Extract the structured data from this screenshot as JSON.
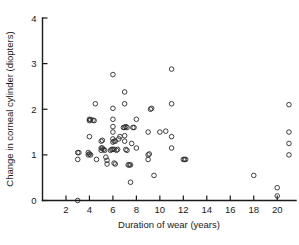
{
  "chart_data": {
    "type": "scatter",
    "title": "",
    "xlabel": "Duration of wear (years)",
    "ylabel": "Change in corneal cylinder (diopters)",
    "xlim": [
      0,
      21.6
    ],
    "ylim": [
      0,
      4
    ],
    "xticks": [
      2,
      4,
      6,
      8,
      10,
      12,
      14,
      16,
      18,
      20
    ],
    "xticklabels": [
      "2",
      "4",
      "6",
      "8",
      "10",
      "12",
      "14",
      "16",
      "18",
      "20"
    ],
    "yticks": [
      0,
      1,
      2,
      3,
      4
    ],
    "yticklabels": [
      "0",
      "1",
      "2",
      "3",
      "4"
    ],
    "grid": false,
    "legend": null,
    "marker": "open-circle",
    "marker_color": "#2b2b2b",
    "points": [
      [
        3.0,
        0.0
      ],
      [
        3.0,
        0.9
      ],
      [
        3.0,
        1.05
      ],
      [
        3.1,
        1.05
      ],
      [
        3.9,
        1.0
      ],
      [
        3.9,
        1.05
      ],
      [
        4.0,
        1.02
      ],
      [
        4.1,
        1.0
      ],
      [
        4.0,
        1.4
      ],
      [
        4.0,
        1.78
      ],
      [
        4.0,
        1.75
      ],
      [
        4.1,
        1.77
      ],
      [
        4.3,
        1.76
      ],
      [
        4.4,
        1.75
      ],
      [
        4.5,
        2.12
      ],
      [
        4.6,
        0.9
      ],
      [
        5.0,
        1.15
      ],
      [
        5.1,
        1.15
      ],
      [
        5.0,
        1.3
      ],
      [
        5.1,
        1.32
      ],
      [
        5.0,
        1.1
      ],
      [
        5.2,
        1.12
      ],
      [
        5.3,
        1.1
      ],
      [
        5.4,
        0.95
      ],
      [
        5.5,
        0.88
      ],
      [
        5.5,
        0.8
      ],
      [
        5.8,
        1.1
      ],
      [
        5.9,
        1.12
      ],
      [
        6.0,
        1.12
      ],
      [
        6.1,
        1.12
      ],
      [
        6.0,
        1.28
      ],
      [
        6.1,
        1.3
      ],
      [
        6.2,
        1.3
      ],
      [
        6.0,
        1.35
      ],
      [
        6.0,
        1.5
      ],
      [
        6.0,
        1.62
      ],
      [
        6.0,
        1.78
      ],
      [
        6.0,
        2.02
      ],
      [
        6.0,
        2.76
      ],
      [
        6.1,
        0.82
      ],
      [
        6.2,
        0.8
      ],
      [
        6.3,
        1.1
      ],
      [
        6.4,
        1.12
      ],
      [
        6.5,
        1.35
      ],
      [
        6.6,
        1.4
      ],
      [
        6.9,
        1.6
      ],
      [
        7.0,
        1.6
      ],
      [
        7.1,
        1.62
      ],
      [
        7.2,
        1.6
      ],
      [
        7.0,
        2.12
      ],
      [
        7.0,
        2.38
      ],
      [
        7.0,
        1.42
      ],
      [
        7.0,
        1.3
      ],
      [
        7.1,
        1.12
      ],
      [
        7.2,
        1.1
      ],
      [
        7.3,
        0.78
      ],
      [
        7.4,
        0.78
      ],
      [
        7.5,
        0.78
      ],
      [
        7.5,
        0.4
      ],
      [
        7.6,
        1.25
      ],
      [
        7.7,
        1.6
      ],
      [
        7.8,
        1.6
      ],
      [
        8.0,
        1.78
      ],
      [
        8.0,
        1.15
      ],
      [
        9.0,
        1.0
      ],
      [
        9.1,
        1.02
      ],
      [
        9.0,
        0.9
      ],
      [
        9.2,
        2.0
      ],
      [
        9.3,
        2.02
      ],
      [
        9.0,
        1.5
      ],
      [
        9.5,
        0.55
      ],
      [
        10.0,
        1.5
      ],
      [
        10.5,
        1.52
      ],
      [
        11.0,
        2.12
      ],
      [
        11.0,
        2.88
      ],
      [
        11.0,
        1.4
      ],
      [
        11.0,
        1.15
      ],
      [
        12.0,
        0.9
      ],
      [
        12.1,
        0.9
      ],
      [
        12.2,
        0.9
      ],
      [
        18.0,
        0.55
      ],
      [
        20.0,
        0.28
      ],
      [
        20.0,
        0.1
      ],
      [
        21.0,
        2.1
      ],
      [
        21.0,
        1.5
      ],
      [
        21.0,
        1.25
      ],
      [
        21.0,
        1.0
      ]
    ]
  },
  "axes": {
    "x_axis_name": "x-axis",
    "y_axis_name": "y-axis"
  }
}
